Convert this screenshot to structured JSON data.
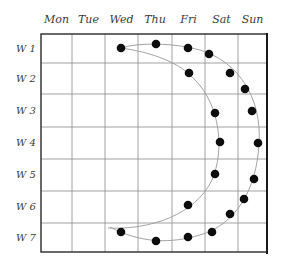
{
  "diagram": {
    "columns": [
      "Mon",
      "Tue",
      "Wed",
      "Thu",
      "Fri",
      "Sat",
      "Sun"
    ],
    "rows": [
      "W 1",
      "W 2",
      "W 3",
      "W 4",
      "W 5",
      "W 6",
      "W 7"
    ],
    "grid": {
      "left": 41,
      "top": 34,
      "right": 267,
      "bottom": 252,
      "x_lines": [
        41,
        72,
        105,
        138,
        172,
        205,
        238,
        267
      ],
      "y_lines": [
        34,
        63,
        94,
        127,
        159,
        191,
        223,
        252
      ]
    },
    "colors": {
      "dot": "#0d0d0d",
      "grid": "#8a8a8a",
      "frame": "#2a2a2a",
      "curve": "#9a9a9a",
      "label": "#3a3a3a"
    },
    "dots": [
      {
        "x": 121,
        "y": 48,
        "curve": "both"
      },
      {
        "x": 156,
        "y": 44,
        "curve": "outer"
      },
      {
        "x": 188,
        "y": 48,
        "curve": "outer"
      },
      {
        "x": 209,
        "y": 54,
        "curve": "outer"
      },
      {
        "x": 230,
        "y": 73,
        "curve": "outer"
      },
      {
        "x": 245,
        "y": 89,
        "curve": "outer"
      },
      {
        "x": 252,
        "y": 111,
        "curve": "outer"
      },
      {
        "x": 258,
        "y": 143,
        "curve": "outer"
      },
      {
        "x": 254,
        "y": 179,
        "curve": "outer"
      },
      {
        "x": 244,
        "y": 199,
        "curve": "outer"
      },
      {
        "x": 230,
        "y": 214,
        "curve": "outer"
      },
      {
        "x": 212,
        "y": 232,
        "curve": "outer"
      },
      {
        "x": 188,
        "y": 237,
        "curve": "outer"
      },
      {
        "x": 156,
        "y": 241,
        "curve": "outer"
      },
      {
        "x": 121,
        "y": 232,
        "curve": "outer"
      },
      {
        "x": 189,
        "y": 73,
        "curve": "inner"
      },
      {
        "x": 215,
        "y": 113,
        "curve": "inner"
      },
      {
        "x": 220,
        "y": 142,
        "curve": "inner"
      },
      {
        "x": 215,
        "y": 174,
        "curve": "inner"
      },
      {
        "x": 188,
        "y": 205,
        "curve": "inner"
      }
    ],
    "curves": {
      "outer": "M 121 48 C 140 42, 175 43, 200 50 C 240 62, 262 100, 259 143 C 257 190, 235 225, 200 235 C 170 244, 140 243, 110 227",
      "inner": "M 121 48 C 150 52, 180 62, 195 80 C 220 105, 225 150, 212 180 C 195 215, 150 230, 108 228"
    }
  }
}
